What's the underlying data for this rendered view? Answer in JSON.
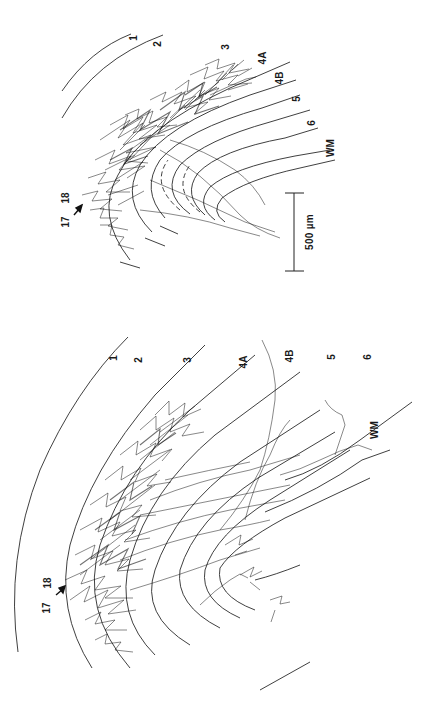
{
  "figure": {
    "orientation": "rotated -90 degrees (landscape figure printed in portrait)",
    "background": "#ffffff",
    "ink_color": "#1a1a1a",
    "panels": [
      {
        "id": "panel-top",
        "layer_labels": [
          "1",
          "2",
          "3",
          "4A",
          "4B",
          "5",
          "6",
          "WM"
        ],
        "area_border": {
          "left": "17",
          "right": "18",
          "arrow": "arrow-icon"
        }
      },
      {
        "id": "panel-bottom",
        "layer_labels": [
          "1",
          "2",
          "3",
          "4A",
          "4B",
          "5",
          "6",
          "WM"
        ],
        "area_border": {
          "left": "17",
          "right": "18",
          "arrow": "arrow-icon"
        }
      }
    ],
    "scale_bar": {
      "label": "500 µm",
      "length_um": 500
    }
  }
}
